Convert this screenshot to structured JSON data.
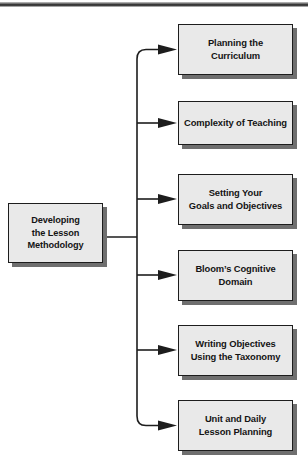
{
  "diagram": {
    "title": "Developing the Lesson Methodology",
    "type": "flowchart-branching",
    "orientation": "left-to-right",
    "source_node": {
      "id": "source",
      "label": "Developing\nthe Lesson\nMethodology"
    },
    "branch_nodes": [
      {
        "id": "branch-1",
        "label": "Planning the\nCurriculum"
      },
      {
        "id": "branch-2",
        "label": "Complexity of Teaching"
      },
      {
        "id": "branch-3",
        "label": "Setting Your\nGoals and Objectives"
      },
      {
        "id": "branch-4",
        "label": "Bloom’s Cognitive\nDomain"
      },
      {
        "id": "branch-5",
        "label": "Writing Objectives\nUsing the Taxonomy"
      },
      {
        "id": "branch-6",
        "label": "Unit and Daily\nLesson Planning"
      }
    ],
    "connector": {
      "style": "orthogonal-rounded-elbow",
      "arrowhead": "solid-triangle",
      "trunk_x": 137
    },
    "colors": {
      "box_fill": "#e9e9e9",
      "box_border": "#1d1d1d",
      "box_shadow": "#6f6f6f",
      "text": "#141414",
      "connector": "#1d1d1d",
      "page_background": "#ffffff",
      "top_rule": "#2c2c2c"
    }
  }
}
